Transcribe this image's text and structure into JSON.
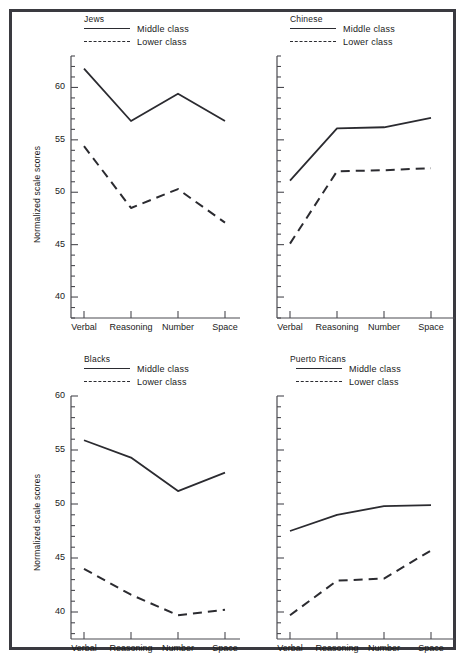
{
  "figure": {
    "background": "#ffffff",
    "frame_color": "#3a3a40",
    "line_color": "#2b2b30",
    "axis_color": "#4a4a50",
    "y_axis_title": "Normalized scale scores",
    "legend": {
      "middle_label": "Middle class",
      "lower_label": "Lower class"
    }
  },
  "chart_data": [
    {
      "type": "line",
      "title": "Jews",
      "xlabel": "",
      "ylabel": "Normalized scale scores",
      "categories": [
        "Verbal",
        "Reasoning",
        "Number",
        "Space"
      ],
      "ylim": [
        38.0,
        63.0
      ],
      "yticks": [
        40,
        45,
        50,
        55,
        60
      ],
      "ytick_labels": [
        "40",
        "45",
        "50",
        "55",
        "60"
      ],
      "minor_tick_step": 1,
      "grid": false,
      "legend_position": "top-center",
      "series": [
        {
          "name": "Middle class",
          "style": "solid",
          "values": [
            61.8,
            56.8,
            59.4,
            56.8
          ]
        },
        {
          "name": "Lower class",
          "style": "dashed",
          "values": [
            54.4,
            48.5,
            50.3,
            47.1
          ]
        }
      ]
    },
    {
      "type": "line",
      "title": "Chinese",
      "xlabel": "",
      "ylabel": "",
      "categories": [
        "Verbal",
        "Reasoning",
        "Number",
        "Space"
      ],
      "ylim": [
        38.0,
        63.0
      ],
      "yticks": [
        40,
        45,
        50,
        55,
        60
      ],
      "ytick_labels": [
        "",
        "",
        "",
        "",
        ""
      ],
      "minor_tick_step": 1,
      "grid": false,
      "legend_position": "top-center",
      "series": [
        {
          "name": "Middle class",
          "style": "solid",
          "values": [
            51.1,
            56.1,
            56.2,
            57.1
          ]
        },
        {
          "name": "Lower class",
          "style": "dashed",
          "values": [
            45.1,
            52.0,
            52.1,
            52.3
          ]
        }
      ]
    },
    {
      "type": "line",
      "title": "Blacks",
      "xlabel": "",
      "ylabel": "Normalized scale scores",
      "categories": [
        "Verbal",
        "Reasoning",
        "Number",
        "Space"
      ],
      "ylim": [
        37.5,
        60.0
      ],
      "yticks": [
        40,
        45,
        50,
        55,
        60
      ],
      "ytick_labels": [
        "40",
        "45",
        "50",
        "55",
        "60"
      ],
      "minor_tick_step": 1,
      "grid": false,
      "legend_position": "top-center",
      "series": [
        {
          "name": "Middle class",
          "style": "solid",
          "values": [
            55.9,
            54.3,
            51.2,
            52.9
          ]
        },
        {
          "name": "Lower class",
          "style": "dashed",
          "values": [
            44.0,
            41.6,
            39.7,
            40.2
          ]
        }
      ]
    },
    {
      "type": "line",
      "title": "Puerto Ricans",
      "xlabel": "",
      "ylabel": "",
      "categories": [
        "Verbal",
        "Reasoning",
        "Number",
        "Space"
      ],
      "ylim": [
        37.5,
        60.0
      ],
      "yticks": [
        40,
        45,
        50,
        55,
        60
      ],
      "ytick_labels": [
        "",
        "",
        "",
        "",
        ""
      ],
      "minor_tick_step": 1,
      "grid": false,
      "legend_position": "top-center",
      "series": [
        {
          "name": "Middle class",
          "style": "solid",
          "values": [
            47.5,
            49.0,
            49.8,
            49.9
          ]
        },
        {
          "name": "Lower class",
          "style": "dashed",
          "values": [
            39.7,
            42.9,
            43.1,
            45.7
          ]
        }
      ]
    }
  ]
}
